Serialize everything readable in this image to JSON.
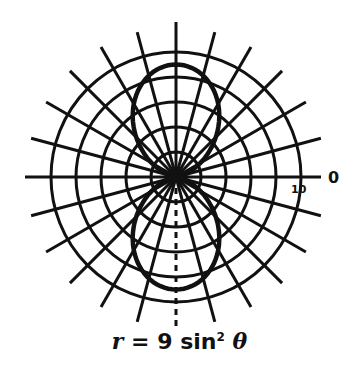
{
  "chart_data": {
    "type": "polar",
    "equation": "r = 9 sin^2 theta",
    "caption_parts": {
      "r": "r",
      "eq": " = 9 sin",
      "sup": "2",
      "theta": " θ"
    },
    "radial_axis": {
      "min": 0,
      "max": 10,
      "rings": [
        2,
        4,
        6,
        8,
        10
      ],
      "tick_labels": [
        "10"
      ]
    },
    "angular_axis": {
      "step_deg": 15,
      "zero_label": "0"
    },
    "series": [
      {
        "name": "r = 9 sin² θ",
        "function": "9*sin(theta)^2",
        "theta_range_deg": [
          0,
          360
        ],
        "max_r": 9
      }
    ],
    "grid": true,
    "legend": null
  },
  "labels": {
    "zero": "0",
    "ten": "10"
  }
}
